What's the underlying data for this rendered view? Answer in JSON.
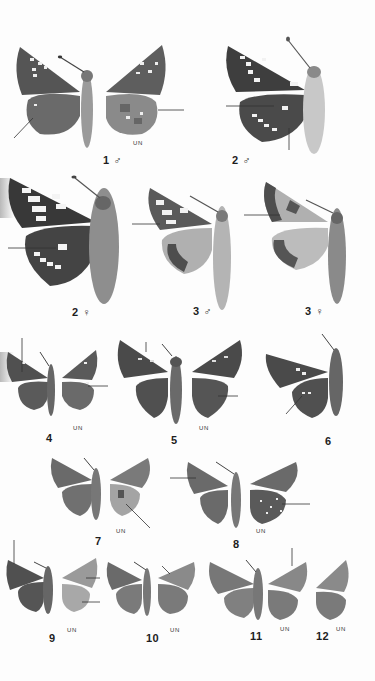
{
  "plate": {
    "background": "#fdfdfd",
    "figures": [
      {
        "id": "1",
        "label": "1 ♂",
        "sex": "male",
        "underside_label": "UN",
        "views": [
          "upperside",
          "underside"
        ]
      },
      {
        "id": "2m",
        "label": "2 ♂",
        "sex": "male",
        "underside_label": null,
        "views": [
          "upperside-half"
        ]
      },
      {
        "id": "2f",
        "label": "2 ♀",
        "sex": "female",
        "underside_label": null,
        "views": [
          "upperside-half"
        ]
      },
      {
        "id": "3m",
        "label": "3 ♂",
        "sex": "male",
        "underside_label": null,
        "views": [
          "upperside-half"
        ]
      },
      {
        "id": "3f",
        "label": "3 ♀",
        "sex": "female",
        "underside_label": null,
        "views": [
          "upperside-half"
        ]
      },
      {
        "id": "4",
        "label": "4",
        "sex": null,
        "underside_label": "UN",
        "views": [
          "upperside",
          "underside"
        ]
      },
      {
        "id": "5",
        "label": "5",
        "sex": null,
        "underside_label": "UN",
        "views": [
          "upperside",
          "underside"
        ]
      },
      {
        "id": "6",
        "label": "6",
        "sex": null,
        "underside_label": null,
        "views": [
          "upperside-half"
        ]
      },
      {
        "id": "7",
        "label": "7",
        "sex": null,
        "underside_label": "UN",
        "views": [
          "upperside",
          "underside"
        ]
      },
      {
        "id": "8",
        "label": "8",
        "sex": null,
        "underside_label": "UN",
        "views": [
          "upperside",
          "underside"
        ]
      },
      {
        "id": "9",
        "label": "9",
        "sex": null,
        "underside_label": "UN",
        "views": [
          "upperside",
          "underside"
        ]
      },
      {
        "id": "10",
        "label": "10",
        "sex": null,
        "underside_label": "UN",
        "views": [
          "upperside",
          "underside"
        ]
      },
      {
        "id": "11",
        "label": "11",
        "sex": null,
        "underside_label": "UN",
        "views": [
          "upperside",
          "underside"
        ]
      },
      {
        "id": "12",
        "label": "12",
        "sex": null,
        "underside_label": "UN",
        "views": [
          "underside"
        ]
      }
    ]
  },
  "labels": {
    "fig1": "1 ♂",
    "fig1_un": "UN",
    "fig2m": "2 ♂",
    "fig2f": "2 ♀",
    "fig3m": "3 ♂",
    "fig3f": "3 ♀",
    "fig4": "4",
    "fig4_un": "UN",
    "fig5": "5",
    "fig5_un": "UN",
    "fig6": "6",
    "fig7": "7",
    "fig7_un": "UN",
    "fig8": "8",
    "fig8_un": "UN",
    "fig9": "9",
    "fig9_un": "UN",
    "fig10": "10",
    "fig10_un": "UN",
    "fig11": "11",
    "fig11_un": "UN",
    "fig12": "12",
    "fig12_un": "UN"
  },
  "colors": {
    "wing_dark": "#4a4a4a",
    "wing_mid": "#7a7a7a",
    "wing_light": "#c8c8c8",
    "spot": "#f0f0f0",
    "body": "#9a9a9a",
    "pointer": "#333333"
  }
}
